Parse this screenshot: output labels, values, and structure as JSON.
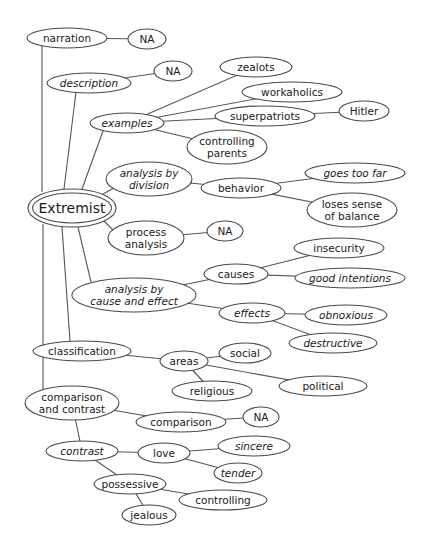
{
  "diagram": {
    "type": "cluster map",
    "root": "Extremist",
    "colors": {
      "background": "#ffffff",
      "stroke": "#4a4a4a",
      "text": "#1a1a1a"
    },
    "nodes": [
      {
        "id": "narration",
        "lines": [
          "narration"
        ],
        "cx": 67,
        "cy": 38,
        "rx": 40,
        "ry": 10,
        "italic": false
      },
      {
        "id": "na1",
        "lines": [
          "NA"
        ],
        "cx": 147,
        "cy": 39,
        "rx": 19,
        "ry": 10,
        "italic": false
      },
      {
        "id": "description",
        "lines": [
          "description"
        ],
        "cx": 89,
        "cy": 83,
        "rx": 42,
        "ry": 10,
        "italic": true
      },
      {
        "id": "na2",
        "lines": [
          "NA"
        ],
        "cx": 173,
        "cy": 71,
        "rx": 19,
        "ry": 10,
        "italic": false
      },
      {
        "id": "examples",
        "lines": [
          "examples"
        ],
        "cx": 127,
        "cy": 123,
        "rx": 37,
        "ry": 10,
        "italic": true
      },
      {
        "id": "zealots",
        "lines": [
          "zealots"
        ],
        "cx": 256,
        "cy": 67,
        "rx": 36,
        "ry": 10,
        "italic": false
      },
      {
        "id": "workaholics",
        "lines": [
          "workaholics"
        ],
        "cx": 292,
        "cy": 92,
        "rx": 50,
        "ry": 10,
        "italic": false
      },
      {
        "id": "superpatriots",
        "lines": [
          "superpatriots"
        ],
        "cx": 265,
        "cy": 116,
        "rx": 50,
        "ry": 10,
        "italic": false
      },
      {
        "id": "hitler",
        "lines": [
          "Hitler"
        ],
        "cx": 364,
        "cy": 111,
        "rx": 25,
        "ry": 10,
        "italic": false
      },
      {
        "id": "controlling_parents",
        "lines": [
          "controlling",
          "parents"
        ],
        "cx": 227,
        "cy": 147,
        "rx": 40,
        "ry": 17,
        "italic": false
      },
      {
        "id": "analysis_division",
        "lines": [
          "analysis by",
          "division"
        ],
        "cx": 149,
        "cy": 179,
        "rx": 43,
        "ry": 17,
        "italic": true
      },
      {
        "id": "behavior",
        "lines": [
          "behavior"
        ],
        "cx": 241,
        "cy": 188,
        "rx": 40,
        "ry": 10,
        "italic": false
      },
      {
        "id": "goes_too_far",
        "lines": [
          "goes too far"
        ],
        "cx": 355,
        "cy": 173,
        "rx": 50,
        "ry": 10,
        "italic": true
      },
      {
        "id": "loses_balance",
        "lines": [
          "loses sense",
          "of balance"
        ],
        "cx": 352,
        "cy": 210,
        "rx": 45,
        "ry": 17,
        "italic": false
      },
      {
        "id": "process_analysis",
        "lines": [
          "process",
          "analysis"
        ],
        "cx": 146,
        "cy": 238,
        "rx": 38,
        "ry": 17,
        "italic": false
      },
      {
        "id": "na3",
        "lines": [
          "NA"
        ],
        "cx": 225,
        "cy": 231,
        "rx": 18,
        "ry": 10,
        "italic": false
      },
      {
        "id": "analysis_cause_effect",
        "lines": [
          "analysis by",
          "cause and effect"
        ],
        "cx": 134,
        "cy": 295,
        "rx": 62,
        "ry": 17,
        "italic": true
      },
      {
        "id": "causes",
        "lines": [
          "causes"
        ],
        "cx": 236,
        "cy": 274,
        "rx": 32,
        "ry": 10,
        "italic": false
      },
      {
        "id": "insecurity",
        "lines": [
          "insecurity"
        ],
        "cx": 339,
        "cy": 248,
        "rx": 45,
        "ry": 10,
        "italic": false
      },
      {
        "id": "good_intentions",
        "lines": [
          "good intentions"
        ],
        "cx": 350,
        "cy": 278,
        "rx": 55,
        "ry": 10,
        "italic": true
      },
      {
        "id": "effects",
        "lines": [
          "effects"
        ],
        "cx": 252,
        "cy": 313,
        "rx": 33,
        "ry": 10,
        "italic": true
      },
      {
        "id": "obnoxious",
        "lines": [
          "obnoxious"
        ],
        "cx": 346,
        "cy": 315,
        "rx": 41,
        "ry": 10,
        "italic": true
      },
      {
        "id": "destructive",
        "lines": [
          "destructive"
        ],
        "cx": 333,
        "cy": 343,
        "rx": 44,
        "ry": 10,
        "italic": true
      },
      {
        "id": "classification",
        "lines": [
          "classification"
        ],
        "cx": 82,
        "cy": 351,
        "rx": 49,
        "ry": 10,
        "italic": false
      },
      {
        "id": "areas",
        "lines": [
          "areas"
        ],
        "cx": 184,
        "cy": 361,
        "rx": 24,
        "ry": 10,
        "italic": false
      },
      {
        "id": "social",
        "lines": [
          "social"
        ],
        "cx": 245,
        "cy": 353,
        "rx": 26,
        "ry": 10,
        "italic": false
      },
      {
        "id": "religious",
        "lines": [
          "religious"
        ],
        "cx": 212,
        "cy": 391,
        "rx": 40,
        "ry": 10,
        "italic": false
      },
      {
        "id": "political",
        "lines": [
          "political"
        ],
        "cx": 323,
        "cy": 386,
        "rx": 44,
        "ry": 10,
        "italic": false
      },
      {
        "id": "comparison_contrast",
        "lines": [
          "comparison",
          "and contrast"
        ],
        "cx": 72,
        "cy": 403,
        "rx": 47,
        "ry": 17,
        "italic": false
      },
      {
        "id": "comparison",
        "lines": [
          "comparison"
        ],
        "cx": 181,
        "cy": 422,
        "rx": 45,
        "ry": 10,
        "italic": false
      },
      {
        "id": "na4",
        "lines": [
          "NA"
        ],
        "cx": 261,
        "cy": 417,
        "rx": 18,
        "ry": 10,
        "italic": false
      },
      {
        "id": "contrast",
        "lines": [
          "contrast"
        ],
        "cx": 82,
        "cy": 451,
        "rx": 36,
        "ry": 10,
        "italic": true
      },
      {
        "id": "love",
        "lines": [
          "love"
        ],
        "cx": 164,
        "cy": 453,
        "rx": 26,
        "ry": 10,
        "italic": false
      },
      {
        "id": "sincere",
        "lines": [
          "sincere"
        ],
        "cx": 254,
        "cy": 446,
        "rx": 36,
        "ry": 10,
        "italic": true
      },
      {
        "id": "tender",
        "lines": [
          "tender"
        ],
        "cx": 238,
        "cy": 473,
        "rx": 24,
        "ry": 10,
        "italic": true
      },
      {
        "id": "possessive",
        "lines": [
          "possessive"
        ],
        "cx": 130,
        "cy": 484,
        "rx": 36,
        "ry": 10,
        "italic": false
      },
      {
        "id": "controlling",
        "lines": [
          "controlling"
        ],
        "cx": 223,
        "cy": 500,
        "rx": 44,
        "ry": 10,
        "italic": false
      },
      {
        "id": "jealous",
        "lines": [
          "jealous"
        ],
        "cx": 149,
        "cy": 515,
        "rx": 27,
        "ry": 10,
        "italic": false
      }
    ],
    "root_node": {
      "id": "extremist",
      "label": "Extremist",
      "cx": 72,
      "cy": 208,
      "rx": 44,
      "ry": 19
    },
    "edges": [
      [
        "narration",
        "na1"
      ],
      [
        "description",
        "na2"
      ],
      [
        "examples",
        "zealots"
      ],
      [
        "examples",
        "workaholics"
      ],
      [
        "examples",
        "superpatriots"
      ],
      [
        "examples",
        "controlling_parents"
      ],
      [
        "superpatriots",
        "hitler"
      ],
      [
        "analysis_division",
        "behavior"
      ],
      [
        "behavior",
        "goes_too_far"
      ],
      [
        "behavior",
        "loses_balance"
      ],
      [
        "process_analysis",
        "na3"
      ],
      [
        "analysis_cause_effect",
        "causes"
      ],
      [
        "analysis_cause_effect",
        "effects"
      ],
      [
        "causes",
        "insecurity"
      ],
      [
        "causes",
        "good_intentions"
      ],
      [
        "effects",
        "obnoxious"
      ],
      [
        "effects",
        "destructive"
      ],
      [
        "classification",
        "areas"
      ],
      [
        "areas",
        "social"
      ],
      [
        "areas",
        "religious"
      ],
      [
        "areas",
        "political"
      ],
      [
        "comparison_contrast",
        "comparison"
      ],
      [
        "comparison",
        "na4"
      ],
      [
        "comparison_contrast",
        "contrast"
      ],
      [
        "contrast",
        "love"
      ],
      [
        "love",
        "sincere"
      ],
      [
        "love",
        "tender"
      ],
      [
        "contrast",
        "possessive"
      ],
      [
        "possessive",
        "controlling"
      ],
      [
        "possessive",
        "jealous"
      ]
    ],
    "root_edges": [
      {
        "to": "narration",
        "x1": 42,
        "y1": 192,
        "x2": 42,
        "y2": 46
      },
      {
        "to": "description",
        "x1": 64,
        "y1": 189,
        "x2": 76,
        "y2": 92
      },
      {
        "to": "examples",
        "x1": 82,
        "y1": 189,
        "x2": 103,
        "y2": 131
      },
      {
        "to": "analysis_division",
        "x1": 103,
        "y1": 194,
        "x2": 114,
        "y2": 188
      },
      {
        "to": "process_analysis",
        "x1": 104,
        "y1": 221,
        "x2": 113,
        "y2": 230
      },
      {
        "to": "analysis_cause_effect",
        "x1": 78,
        "y1": 227,
        "x2": 91,
        "y2": 282
      },
      {
        "to": "classification",
        "x1": 62,
        "y1": 227,
        "x2": 70,
        "y2": 341
      },
      {
        "to": "comparison_contrast",
        "x1": 43,
        "y1": 224,
        "x2": 43,
        "y2": 390
      }
    ]
  }
}
